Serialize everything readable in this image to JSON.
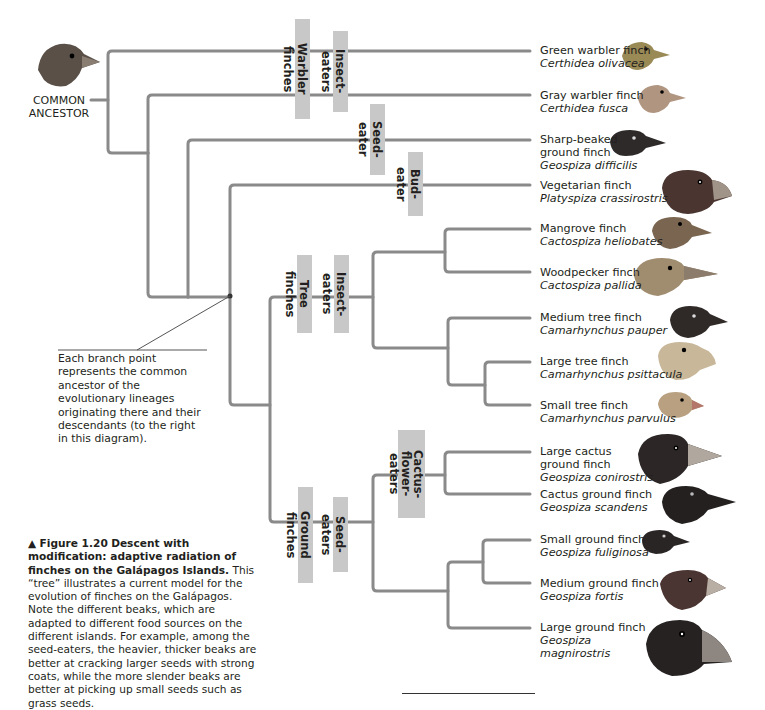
{
  "colors": {
    "branch": "#8a8a8a",
    "label_bg": "#c8c8c8",
    "text": "#231f20"
  },
  "ancestor": {
    "label": "COMMON ANCESTOR",
    "line1": "COMMON",
    "line2": "ANCESTOR",
    "icon": "finch-head-icon"
  },
  "clade_labels": {
    "warbler_finches": "Warbler finches",
    "insect_eaters_top": "Insect-eaters",
    "seed_eater": "Seed-eater",
    "bud_eater": "Bud-eater",
    "tree_finches": "Tree finches",
    "insect_eaters_tree": "Insect-eaters",
    "ground_finches": "Ground finches",
    "seed_eaters": "Seed-eaters",
    "cactus_flower_eaters_1": "Cactus-flower-",
    "cactus_flower_eaters_2": "eaters"
  },
  "species": [
    {
      "common": "Green warbler finch",
      "sci": "Certhidea olivacea",
      "color": "#9a8a55"
    },
    {
      "common": "Gray warbler finch",
      "sci": "Certhidea fusca",
      "color": "#a8907a"
    },
    {
      "common": "Sharp-beaked ground finch",
      "common1": "Sharp-beaked",
      "common2": "ground finch",
      "sci": "Geospiza difficilis",
      "color": "#2e2a2a"
    },
    {
      "common": "Vegetarian finch",
      "sci": "Platyspiza crassirostris",
      "color": "#4a3530"
    },
    {
      "common": "Mangrove finch",
      "sci": "Cactospiza heliobates",
      "color": "#7a6650"
    },
    {
      "common": "Woodpecker finch",
      "sci": "Cactospiza pallida",
      "color": "#a08c6e"
    },
    {
      "common": "Medium tree finch",
      "sci": "Camarhynchus pauper",
      "color": "#2f2a28"
    },
    {
      "common": "Large tree finch",
      "sci": "Camarhynchus psittacula",
      "color": "#c9b79a"
    },
    {
      "common": "Small tree finch",
      "sci": "Camarhynchus parvulus",
      "color": "#b8a080"
    },
    {
      "common": "Large cactus ground finch",
      "common1": "Large cactus",
      "common2": "ground finch",
      "sci": "Geospiza conirostris",
      "color": "#2c2726"
    },
    {
      "common": "Cactus ground finch",
      "sci": "Geospiza scandens",
      "color": "#242020"
    },
    {
      "common": "Small ground finch",
      "sci": "Geospiza fuliginosa",
      "color": "#2a2525"
    },
    {
      "common": "Medium ground finch",
      "sci": "Geospiza fortis",
      "color": "#4b3532"
    },
    {
      "common": "Large ground finch",
      "sci": "Geospiza magnirostris",
      "sci1": "Geospiza",
      "sci2": "magnirostris",
      "color": "#262222"
    }
  ],
  "callout": {
    "text": "Each branch point represents the common ancestor of the evolutionary lineages originating there and their descendants (to the right in this diagram)."
  },
  "caption": {
    "marker": "▲",
    "figure": "Figure 1.20",
    "title": "Descent with modification: adaptive radiation of finches on the Galápagos Islands.",
    "body": "This “tree” illustrates a current model for the evolution of finches on the Galápagos. Note the different beaks, which are adapted to different food sources on the different islands. For example, among the seed-eaters, the heavier, thicker beaks are better at cracking larger seeds with strong coats, while the more slender beaks are better at picking up small seeds such as grass seeds."
  }
}
